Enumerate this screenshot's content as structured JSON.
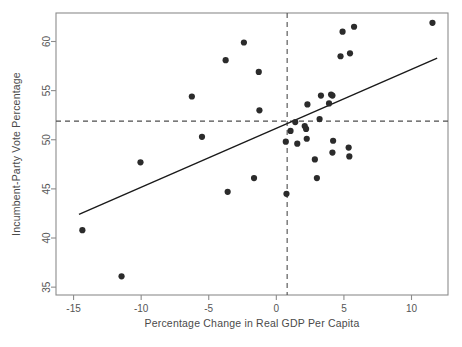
{
  "chart_data": {
    "type": "scatter",
    "title": "",
    "xlabel": "Percentage Change in Real GDP Per Capita",
    "ylabel": "Incumbent-Party Vote Percentage",
    "xlim": [
      -16.3,
      12.7
    ],
    "ylim": [
      34.2,
      62.9
    ],
    "xticks": [
      -15,
      -10,
      -5,
      0,
      5,
      10
    ],
    "xtick_labels": [
      "-15",
      "-10",
      "-5",
      "0",
      "5",
      "10"
    ],
    "yticks": [
      35,
      40,
      45,
      50,
      55,
      60
    ],
    "ytick_labels": [
      "35",
      "40",
      "45",
      "50",
      "55",
      "60"
    ],
    "grid": false,
    "legend": null,
    "point_color": "#2b2b2b",
    "point_radius": 3.1,
    "line_color": "#1a1a1a",
    "reference_line_color": "#4d4d4d",
    "points": [
      {
        "x": -14.35,
        "y": 40.8
      },
      {
        "x": -11.45,
        "y": 36.1
      },
      {
        "x": -10.05,
        "y": 47.7
      },
      {
        "x": -6.25,
        "y": 54.4
      },
      {
        "x": -5.5,
        "y": 50.3
      },
      {
        "x": -3.75,
        "y": 58.1
      },
      {
        "x": -3.6,
        "y": 44.7
      },
      {
        "x": -2.4,
        "y": 59.9
      },
      {
        "x": -1.65,
        "y": 46.1
      },
      {
        "x": -1.3,
        "y": 56.9
      },
      {
        "x": -1.25,
        "y": 53.0
      },
      {
        "x": 0.7,
        "y": 49.8
      },
      {
        "x": 0.75,
        "y": 44.5
      },
      {
        "x": 1.05,
        "y": 50.9
      },
      {
        "x": 1.4,
        "y": 51.8
      },
      {
        "x": 1.55,
        "y": 49.6
      },
      {
        "x": 2.1,
        "y": 51.4
      },
      {
        "x": 2.2,
        "y": 51.1
      },
      {
        "x": 2.25,
        "y": 50.1
      },
      {
        "x": 2.3,
        "y": 53.6
      },
      {
        "x": 2.85,
        "y": 48.0
      },
      {
        "x": 3.0,
        "y": 46.1
      },
      {
        "x": 3.2,
        "y": 52.1
      },
      {
        "x": 3.3,
        "y": 54.5
      },
      {
        "x": 3.9,
        "y": 53.7
      },
      {
        "x": 4.05,
        "y": 54.6
      },
      {
        "x": 4.15,
        "y": 54.5
      },
      {
        "x": 4.2,
        "y": 49.9
      },
      {
        "x": 4.15,
        "y": 48.7
      },
      {
        "x": 4.75,
        "y": 58.5
      },
      {
        "x": 4.9,
        "y": 61.0
      },
      {
        "x": 5.35,
        "y": 49.2
      },
      {
        "x": 5.4,
        "y": 48.3
      },
      {
        "x": 5.45,
        "y": 58.8
      },
      {
        "x": 5.75,
        "y": 61.5
      },
      {
        "x": 11.55,
        "y": 61.9
      }
    ],
    "regression_line": {
      "x1": -14.6,
      "y1": 42.4,
      "x2": 11.9,
      "y2": 58.3
    },
    "reference_lines": {
      "vertical_x": 0.8,
      "horizontal_y": 51.9
    }
  }
}
